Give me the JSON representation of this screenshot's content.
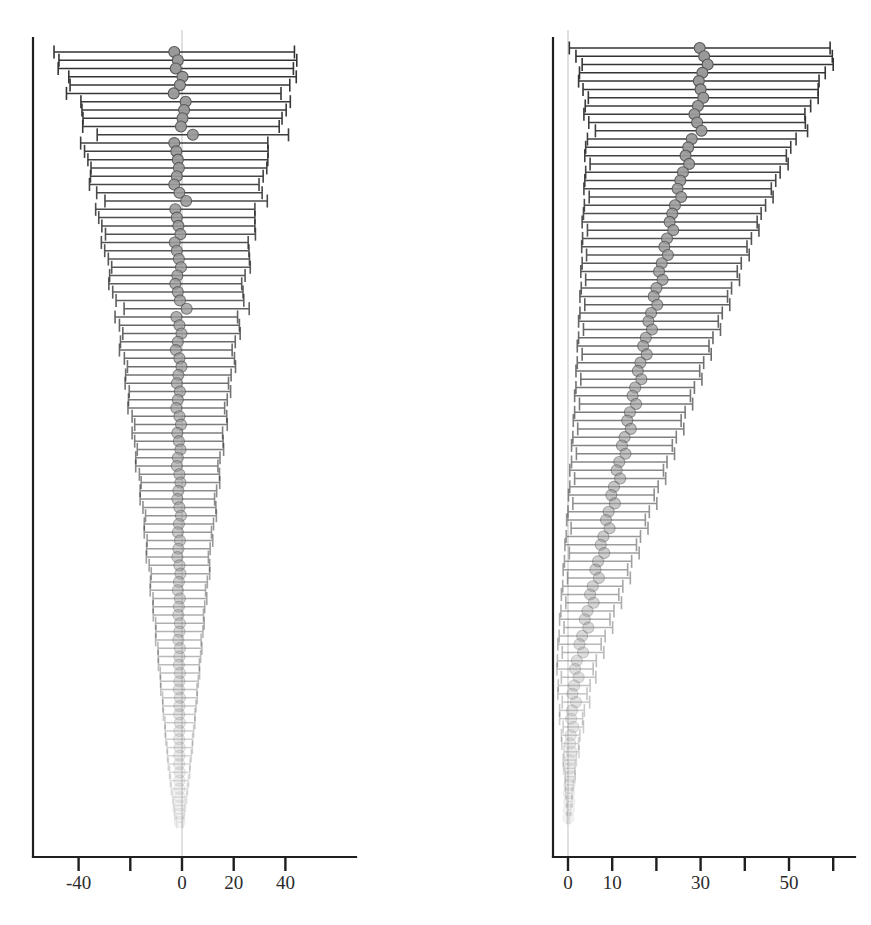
{
  "figure": {
    "kind": "caterpillar-forest-plot",
    "panel_count": 2,
    "marker": {
      "shape": "circle",
      "diameter_px": 11,
      "fill": "#9a9a9a",
      "stroke": "#555555"
    },
    "bar": {
      "stroke": "#333333",
      "cap_height_px": 13
    },
    "ink_fade": {
      "top_opacity": 1.0,
      "bottom_opacity": 0.1
    }
  },
  "chart_data": [
    {
      "id": "left",
      "type": "scatter",
      "orientation": "horizontal",
      "title": "",
      "subtitle": "",
      "xlabel": "",
      "ylabel": "",
      "grid": false,
      "legend": null,
      "xlim": [
        -52,
        58
      ],
      "xticks": [
        -40,
        -20,
        0,
        20,
        40
      ],
      "xticklabels": [
        "-40",
        "",
        "0",
        "20",
        "40"
      ],
      "reference_line_x": 0,
      "n_rows": 94,
      "row_order": "descending confidence-interval width",
      "series": [
        {
          "name": "Point estimate with 95% CI",
          "estimates": [
            -3.0,
            -1.6,
            -2.4,
            0.2,
            -0.8,
            -3.2,
            1.4,
            0.8,
            0.2,
            -0.4,
            4.2,
            -3.0,
            -2.2,
            -1.6,
            -1.2,
            -2.0,
            -3.0,
            -1.0,
            1.6,
            -2.6,
            -2.0,
            -1.4,
            -0.6,
            -2.8,
            -2.0,
            -1.2,
            -0.4,
            -1.8,
            -2.6,
            -1.6,
            -0.8,
            1.8,
            -2.2,
            -1.0,
            -0.2,
            -1.6,
            -2.4,
            -1.0,
            -0.2,
            -1.4,
            -2.0,
            -0.8,
            -1.6,
            -2.2,
            -1.0,
            -0.4,
            -1.8,
            -1.2,
            -0.6,
            -1.6,
            -2.0,
            -1.0,
            -0.6,
            -1.4,
            -1.8,
            -1.0,
            -0.4,
            -1.2,
            -1.6,
            -0.8,
            -1.4,
            -1.8,
            -1.0,
            -0.6,
            -1.2,
            -1.6,
            -0.8,
            -1.2,
            -1.4,
            -0.8,
            -1.0,
            -1.4,
            -0.8,
            -1.0,
            -1.2,
            -0.8,
            -1.0,
            -1.2,
            -0.8,
            -1.0,
            -1.1,
            -0.8,
            -1.0,
            -1.1,
            -0.9,
            -1.0,
            -1.1,
            -0.9,
            -1.0,
            -1.0,
            -0.9,
            -1.0,
            -1.0,
            -0.9
          ],
          "ci_halfwidths": [
            46.5,
            46.0,
            45.5,
            44.0,
            42.5,
            41.5,
            40.5,
            39.5,
            38.5,
            38.0,
            37.0,
            36.2,
            35.5,
            34.8,
            34.0,
            33.4,
            32.8,
            32.0,
            31.4,
            30.8,
            30.2,
            29.6,
            29.0,
            28.4,
            27.9,
            27.3,
            26.8,
            26.2,
            25.7,
            25.2,
            24.7,
            24.2,
            23.7,
            23.2,
            22.7,
            22.2,
            21.8,
            21.3,
            20.9,
            20.4,
            20.0,
            19.6,
            19.1,
            18.7,
            18.3,
            17.9,
            17.5,
            17.1,
            16.7,
            16.3,
            15.9,
            15.5,
            15.2,
            14.8,
            14.4,
            14.1,
            13.7,
            13.4,
            13.0,
            12.7,
            12.3,
            12.0,
            11.7,
            11.3,
            11.0,
            10.7,
            10.4,
            10.0,
            9.7,
            9.4,
            9.1,
            8.8,
            8.5,
            8.2,
            7.9,
            7.6,
            7.3,
            7.0,
            6.7,
            6.4,
            6.1,
            5.8,
            5.5,
            5.2,
            4.9,
            4.6,
            4.2,
            3.9,
            3.5,
            3.1,
            2.7,
            2.3,
            1.8,
            1.2
          ]
        }
      ]
    },
    {
      "id": "right",
      "type": "scatter",
      "orientation": "horizontal",
      "title": "",
      "subtitle": "",
      "xlabel": "",
      "ylabel": "",
      "grid": false,
      "legend": null,
      "xlim": [
        -1,
        64
      ],
      "xticks": [
        0,
        10,
        20,
        30,
        40,
        50,
        60
      ],
      "xticklabels": [
        "0",
        "10",
        "",
        "30",
        "",
        "50",
        ""
      ],
      "reference_line_x": 0,
      "n_rows": 94,
      "row_order": "descending confidence-interval width",
      "series": [
        {
          "name": "Point estimate with 95% CI",
          "estimates": [
            29.8,
            30.8,
            31.6,
            30.4,
            29.6,
            30.0,
            30.6,
            29.4,
            28.6,
            29.2,
            30.2,
            28.0,
            27.2,
            26.6,
            27.4,
            26.0,
            25.4,
            24.8,
            25.6,
            24.2,
            23.6,
            23.0,
            23.8,
            22.4,
            21.8,
            22.6,
            21.2,
            20.6,
            21.4,
            20.0,
            19.4,
            20.2,
            18.8,
            18.2,
            19.0,
            17.6,
            17.0,
            17.8,
            16.4,
            15.8,
            16.6,
            15.2,
            14.6,
            15.4,
            14.0,
            13.4,
            14.2,
            12.8,
            12.2,
            13.0,
            11.6,
            11.0,
            11.8,
            10.4,
            9.8,
            10.6,
            9.2,
            8.6,
            9.4,
            8.0,
            7.4,
            8.2,
            6.8,
            6.2,
            7.0,
            5.6,
            5.0,
            5.8,
            4.4,
            3.8,
            4.6,
            3.2,
            2.6,
            3.4,
            2.0,
            1.6,
            2.4,
            1.4,
            1.0,
            1.8,
            0.9,
            0.7,
            1.2,
            0.6,
            0.5,
            0.8,
            0.4,
            0.3,
            0.5,
            0.3,
            0.2,
            0.3,
            0.2,
            0.1
          ],
          "ci_halfwidths": [
            29.5,
            29.0,
            28.4,
            27.8,
            27.2,
            26.6,
            26.0,
            25.5,
            25.0,
            24.5,
            24.0,
            23.6,
            23.2,
            22.8,
            22.4,
            22.0,
            21.6,
            21.2,
            20.8,
            20.5,
            20.1,
            19.8,
            19.4,
            19.1,
            18.7,
            18.4,
            18.0,
            17.7,
            17.4,
            17.0,
            16.7,
            16.4,
            16.1,
            15.8,
            15.5,
            15.2,
            14.9,
            14.6,
            14.3,
            14.0,
            13.7,
            13.4,
            13.1,
            12.8,
            12.5,
            12.2,
            12.0,
            11.7,
            11.4,
            11.1,
            10.8,
            10.6,
            10.3,
            10.0,
            9.7,
            9.5,
            9.2,
            8.9,
            8.7,
            8.4,
            8.1,
            7.9,
            7.6,
            7.3,
            7.1,
            6.8,
            6.5,
            6.3,
            6.0,
            5.7,
            5.5,
            5.2,
            4.9,
            4.7,
            4.4,
            4.1,
            3.9,
            3.6,
            3.3,
            3.1,
            2.8,
            2.6,
            2.3,
            2.1,
            1.9,
            1.7,
            1.5,
            1.3,
            1.1,
            0.9,
            0.7,
            0.6,
            0.4,
            0.3
          ]
        }
      ]
    }
  ]
}
